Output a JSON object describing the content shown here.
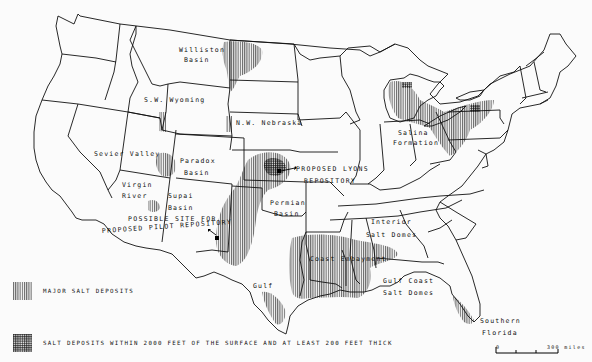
{
  "map": {
    "subject": "Salt deposits of the United States",
    "regions": [
      {
        "id": "williston",
        "label_lines": [
          "Williston",
          "Basin"
        ]
      },
      {
        "id": "sw-wyoming",
        "label_lines": [
          "S.W. Wyoming"
        ]
      },
      {
        "id": "nw-nebraska",
        "label_lines": [
          "N.W. Nebraska"
        ]
      },
      {
        "id": "sevier",
        "label_lines": [
          "Sevier Valley"
        ]
      },
      {
        "id": "paradox",
        "label_lines": [
          "Paradox",
          "Basin"
        ]
      },
      {
        "id": "virgin",
        "label_lines": [
          "Virgin",
          "River"
        ]
      },
      {
        "id": "supai",
        "label_lines": [
          "Supai",
          "Basin"
        ]
      },
      {
        "id": "permian",
        "label_lines": [
          "Permian",
          "Basin"
        ]
      },
      {
        "id": "salina",
        "label_lines": [
          "Salina",
          "Formation"
        ]
      },
      {
        "id": "interior",
        "label_lines": [
          "Interior",
          "Salt Domes"
        ]
      },
      {
        "id": "coast-embayment",
        "label_lines": [
          "Coast Embayment"
        ]
      },
      {
        "id": "gulf",
        "label_lines": [
          "Gulf"
        ]
      },
      {
        "id": "gulf-coast",
        "label_lines": [
          "Gulf Coast",
          "Salt Domes"
        ]
      },
      {
        "id": "southern-florida",
        "label_lines": [
          "Southern",
          "Florida"
        ]
      }
    ],
    "sites": [
      {
        "id": "lyons",
        "label_lines": [
          "PROPOSED LYONS",
          "REPOSITORY"
        ]
      },
      {
        "id": "pilot",
        "label_lines": [
          "POSSIBLE SITE FOR",
          "PROPOSED PILOT REPOSITORY"
        ]
      }
    ]
  },
  "legend": {
    "items": [
      {
        "pattern": "vertical-hatch",
        "label": "MAJOR SALT DEPOSITS"
      },
      {
        "pattern": "crosshatch",
        "label": "SALT DEPOSITS WITHIN 2000 FEET OF THE SURFACE AND AT LEAST 200 FEET THICK"
      }
    ]
  },
  "scale_bar": {
    "min_label": "0",
    "max_label": "300 miles"
  }
}
